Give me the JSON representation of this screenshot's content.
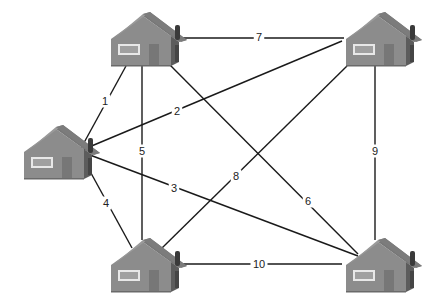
{
  "diagram": {
    "type": "weighted-graph",
    "colors": {
      "edge": "#1a1a1a",
      "wall": "#8c8c8c",
      "roof": "#7a7a7a",
      "roof_highlight": "#9a9a9a",
      "side": "#5c5c5c",
      "chimney": "#3a3a3a",
      "window_frame": "#e8e8e8",
      "window_fill": "#a0a0a0",
      "door": "#777777"
    },
    "nodes": [
      {
        "id": "H1",
        "name": "house-top-left",
        "x": 140,
        "y": 12
      },
      {
        "id": "H2",
        "name": "house-top-right",
        "x": 375,
        "y": 12
      },
      {
        "id": "H3",
        "name": "house-left",
        "x": 53,
        "y": 125
      },
      {
        "id": "H4",
        "name": "house-bottom-left",
        "x": 140,
        "y": 238
      },
      {
        "id": "H5",
        "name": "house-bottom-right",
        "x": 375,
        "y": 238
      }
    ],
    "edges": [
      {
        "from": "H3",
        "to": "H1",
        "weight": "1",
        "x1": 80,
        "y1": 150,
        "x2": 126,
        "y2": 66,
        "lx": 105,
        "ly": 101
      },
      {
        "from": "H3",
        "to": "H2",
        "weight": "2",
        "x1": 82,
        "y1": 150,
        "x2": 342,
        "y2": 41,
        "lx": 177,
        "ly": 111
      },
      {
        "from": "H3",
        "to": "H5",
        "weight": "3",
        "x1": 82,
        "y1": 152,
        "x2": 358,
        "y2": 256,
        "lx": 174,
        "ly": 188
      },
      {
        "from": "H3",
        "to": "H4",
        "weight": "4",
        "x1": 80,
        "y1": 153,
        "x2": 132,
        "y2": 248,
        "lx": 106,
        "ly": 203
      },
      {
        "from": "H1",
        "to": "H4",
        "weight": "5",
        "x1": 142,
        "y1": 66,
        "x2": 142,
        "y2": 240,
        "lx": 142,
        "ly": 151
      },
      {
        "from": "H1",
        "to": "H5",
        "weight": "6",
        "x1": 168,
        "y1": 63,
        "x2": 358,
        "y2": 254,
        "lx": 308,
        "ly": 201
      },
      {
        "from": "H1",
        "to": "H2",
        "weight": "7",
        "x1": 180,
        "y1": 38,
        "x2": 344,
        "y2": 38,
        "lx": 259,
        "ly": 37
      },
      {
        "from": "H4",
        "to": "H2",
        "weight": "8",
        "x1": 162,
        "y1": 248,
        "x2": 347,
        "y2": 66,
        "lx": 236,
        "ly": 176
      },
      {
        "from": "H2",
        "to": "H5",
        "weight": "9",
        "x1": 375,
        "y1": 66,
        "x2": 375,
        "y2": 240,
        "lx": 375,
        "ly": 151
      },
      {
        "from": "H4",
        "to": "H5",
        "weight": "10",
        "x1": 180,
        "y1": 264,
        "x2": 342,
        "y2": 264,
        "lx": 259,
        "ly": 264
      }
    ]
  }
}
